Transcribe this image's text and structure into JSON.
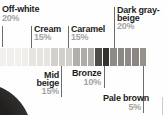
{
  "chart_data": {
    "type": "pie",
    "title": "",
    "subtitle": "",
    "categories": [
      "Off-white",
      "Cream",
      "Mid beige",
      "Caramel",
      "Bronze",
      "Dark gray-beige",
      "Pale brown"
    ],
    "values": [
      20,
      15,
      15,
      15,
      10,
      20,
      5
    ],
    "unit": "%",
    "legend_position": "callout labels above and below a horizontal swatch strip",
    "strip_order": [
      "Off-white",
      "Cream",
      "Mid beige",
      "Caramel",
      "Bronze",
      "Dark gray-beige",
      "Pale brown"
    ],
    "group_colors": {
      "Off-white": "#f1efec",
      "Cream": "#e7e4e0",
      "Mid beige": "#d2cfca",
      "Caramel": "#b0ada8",
      "Bronze": "#413d39",
      "Dark gray-beige": "#8b8884",
      "Pale brown": "#979289"
    }
  },
  "labels": {
    "off_white": {
      "name": "Off-white",
      "pct": "20%"
    },
    "cream": {
      "name": "Cream",
      "pct": "15%"
    },
    "caramel": {
      "name": "Caramel",
      "pct": "15%"
    },
    "dark_gray_beige": {
      "line1": "Dark gray-",
      "line2": "beige",
      "pct": "20%"
    },
    "mid_beige": {
      "line1": "Mid",
      "line2": "beige",
      "pct": "15%"
    },
    "bronze": {
      "name": "Bronze",
      "pct": "10%"
    },
    "pale_brown": {
      "name": "Pale brown",
      "pct": "5%"
    }
  },
  "swatches": [
    {
      "group": "Off-white",
      "hex": "#f2f0ed"
    },
    {
      "group": "Off-white",
      "hex": "#f1efec"
    },
    {
      "group": "Off-white",
      "hex": "#f2f0ed"
    },
    {
      "group": "Off-white",
      "hex": "#f0eeeb"
    },
    {
      "group": "Cream",
      "hex": "#e8e5e1"
    },
    {
      "group": "Cream",
      "hex": "#e7e4e0"
    },
    {
      "group": "Cream",
      "hex": "#e8e5e1"
    },
    {
      "group": "Mid beige",
      "hex": "#d4d1cc"
    },
    {
      "group": "Mid beige",
      "hex": "#d2cfca"
    },
    {
      "group": "Mid beige",
      "hex": "#d3d0cb"
    },
    {
      "group": "Caramel",
      "hex": "#b2afaa"
    },
    {
      "group": "Caramel",
      "hex": "#b0ada8"
    },
    {
      "group": "Caramel",
      "hex": "#b1aea9"
    },
    {
      "group": "Bronze",
      "hex": "#504c48"
    },
    {
      "group": "Bronze",
      "hex": "#36332f"
    },
    {
      "group": "Dark gray-beige",
      "hex": "#8e8b87"
    },
    {
      "group": "Dark gray-beige",
      "hex": "#8b8884"
    },
    {
      "group": "Dark gray-beige",
      "hex": "#8d8a86"
    },
    {
      "group": "Dark gray-beige",
      "hex": "#8a8783"
    },
    {
      "group": "Pale brown",
      "hex": "#979289"
    }
  ]
}
